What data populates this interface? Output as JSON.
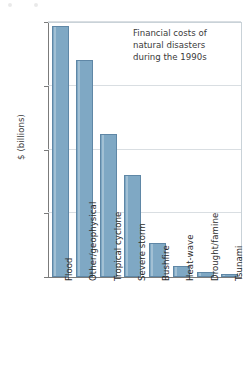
{
  "chart_data": {
    "type": "bar",
    "title": "",
    "annotation": "Financial costs of natural disasters during the 1990s",
    "annotation_lines": [
      "Financial costs of",
      "natural disasters",
      "during the 1990s"
    ],
    "xlabel": "",
    "ylabel": "$ (billions)",
    "ylim": [
      0,
      200
    ],
    "yticks": [
      0,
      50,
      100,
      150,
      200
    ],
    "ytick_labels": [
      "0",
      "50",
      "100",
      "150",
      "200"
    ],
    "grid": true,
    "legend": "none",
    "categories": [
      "Flood",
      "Other/geophysical",
      "Tropical cyclone",
      "Severe storm",
      "Bushfire",
      "Heat-wave",
      "Drought/famine",
      "Tsunami"
    ],
    "values": [
      197,
      170,
      112,
      80,
      27,
      9,
      4,
      2
    ],
    "bar_color": "#7fa8c4",
    "bar_edge_color": "#5f87a6",
    "grid_color": "#d9dee2",
    "axis_color": "#7b7b7b"
  }
}
